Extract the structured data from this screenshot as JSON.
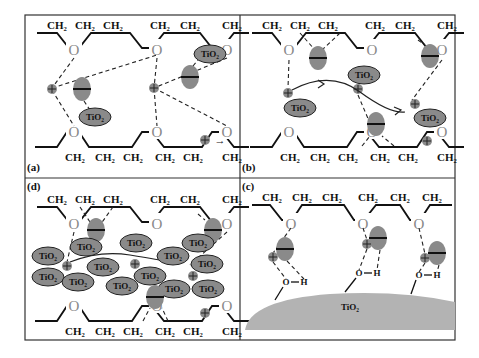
{
  "panels": {
    "a": {
      "label": "(a)"
    },
    "b": {
      "label": "(b)"
    },
    "c": {
      "label": "(c)"
    },
    "d": {
      "label": "(d)"
    }
  },
  "labels": {
    "ch2": "CH₂",
    "oxygen": "O",
    "tio2": "TiO₂",
    "hydroxyl_o": "O",
    "hydroxyl_h": "H",
    "tio2_surface": "TiO₂",
    "arrow": "→"
  },
  "colors": {
    "particle": "#8a8a8a",
    "surface": "#b3b3b3",
    "line": "#111111"
  }
}
